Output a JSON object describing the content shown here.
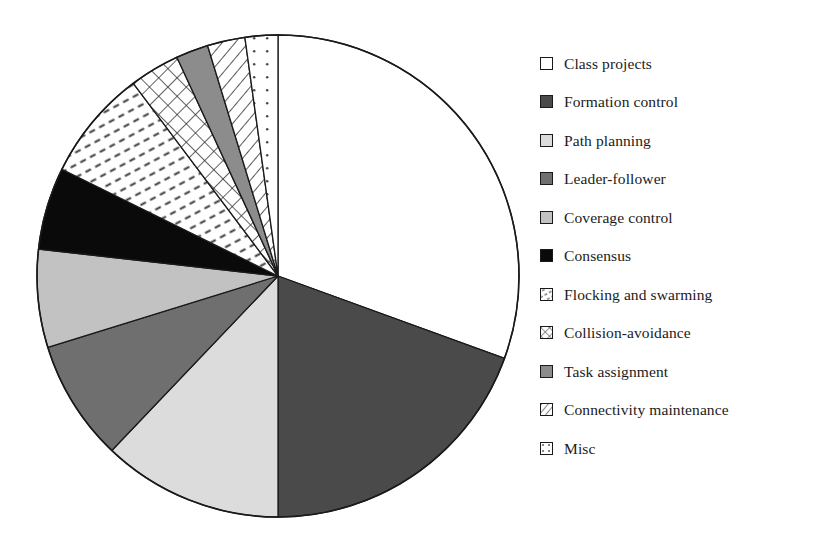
{
  "chart_data": {
    "type": "pie",
    "title": "",
    "subtitle": "",
    "xlabel": "",
    "ylabel": "",
    "legend_position": "right",
    "grid": false,
    "start_angle_deg": 0,
    "direction": "clockwise",
    "categories": [
      "Class projects",
      "Formation control",
      "Path planning",
      "Leader-follower",
      "Coverage control",
      "Consensus",
      "Flocking and swarming",
      "Collision-avoidance",
      "Task assignment",
      "Connectivity maintenance",
      "Misc"
    ],
    "values": [
      30.5,
      19.4,
      12.1,
      8.1,
      6.6,
      5.5,
      7.4,
      3.4,
      2.2,
      2.5,
      2.2
    ],
    "angles_deg": [
      110.0,
      70.0,
      43.6,
      29.2,
      23.6,
      19.9,
      26.8,
      12.1,
      7.8,
      9.1,
      7.9
    ],
    "slices": [
      {
        "label": "Class projects",
        "value": 30.5,
        "start_deg": 0.0,
        "end_deg": 110.0,
        "fill": "#ffffff",
        "pattern": "solid"
      },
      {
        "label": "Formation control",
        "value": 19.4,
        "start_deg": 110.0,
        "end_deg": 180.0,
        "fill": "#4a4a4a",
        "pattern": "solid"
      },
      {
        "label": "Path planning",
        "value": 12.1,
        "start_deg": 180.0,
        "end_deg": 223.6,
        "fill": "#dcdcdc",
        "pattern": "solid"
      },
      {
        "label": "Leader-follower",
        "value": 8.1,
        "start_deg": 223.6,
        "end_deg": 252.8,
        "fill": "#6f6f6f",
        "pattern": "solid"
      },
      {
        "label": "Coverage control",
        "value": 6.6,
        "start_deg": 252.8,
        "end_deg": 276.4,
        "fill": "#c2c2c2",
        "pattern": "solid"
      },
      {
        "label": "Consensus",
        "value": 5.5,
        "start_deg": 276.4,
        "end_deg": 296.3,
        "fill": "#0a0a0a",
        "pattern": "solid"
      },
      {
        "label": "Flocking and swarming",
        "value": 7.4,
        "start_deg": 296.3,
        "end_deg": 323.1,
        "fill": "#ffffff",
        "pattern": "dashes"
      },
      {
        "label": "Collision-avoidance",
        "value": 3.4,
        "start_deg": 323.1,
        "end_deg": 335.2,
        "fill": "#ffffff",
        "pattern": "crosshatch"
      },
      {
        "label": "Task assignment",
        "value": 2.2,
        "start_deg": 335.2,
        "end_deg": 343.0,
        "fill": "#8c8c8c",
        "pattern": "solid"
      },
      {
        "label": "Connectivity maintenance",
        "value": 2.5,
        "start_deg": 343.0,
        "end_deg": 352.1,
        "fill": "#ffffff",
        "pattern": "diagonal"
      },
      {
        "label": "Misc",
        "value": 2.2,
        "start_deg": 352.1,
        "end_deg": 360.0,
        "fill": "#ffffff",
        "pattern": "dots"
      }
    ]
  },
  "legend": {
    "items": [
      {
        "label": "Class projects",
        "swatch": "swatch-white",
        "pattern": "solid",
        "fill": "#ffffff"
      },
      {
        "label": "Formation control",
        "swatch": "swatch-dark-gray",
        "pattern": "solid",
        "fill": "#4a4a4a"
      },
      {
        "label": "Path planning",
        "swatch": "swatch-light-gray",
        "pattern": "solid",
        "fill": "#dcdcdc"
      },
      {
        "label": "Leader-follower",
        "swatch": "swatch-mid-dark",
        "pattern": "solid",
        "fill": "#6f6f6f"
      },
      {
        "label": "Coverage control",
        "swatch": "swatch-mid-light",
        "pattern": "solid",
        "fill": "#c2c2c2"
      },
      {
        "label": "Consensus",
        "swatch": "swatch-black",
        "pattern": "solid",
        "fill": "#0a0a0a"
      },
      {
        "label": "Flocking and swarming",
        "swatch": "swatch-dashes",
        "pattern": "dashes",
        "fill": "#ffffff"
      },
      {
        "label": "Collision-avoidance",
        "swatch": "swatch-crosshatch",
        "pattern": "crosshatch",
        "fill": "#ffffff"
      },
      {
        "label": "Task assignment",
        "swatch": "swatch-gray-solid",
        "pattern": "solid",
        "fill": "#8c8c8c"
      },
      {
        "label": "Connectivity maintenance",
        "swatch": "swatch-diagonal",
        "pattern": "diagonal",
        "fill": "#ffffff"
      },
      {
        "label": "Misc",
        "swatch": "swatch-dots",
        "pattern": "dots",
        "fill": "#ffffff"
      }
    ]
  },
  "colors": {
    "outline": "#1a1a1a",
    "background": "#ffffff",
    "text": "#1b1b1b"
  },
  "geometry": {
    "center_x": 248,
    "center_y": 254,
    "radius": 241
  }
}
